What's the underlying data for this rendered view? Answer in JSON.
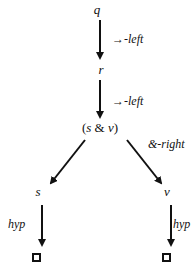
{
  "nodes": {
    "q": "q",
    "r": "r",
    "conj_open": "(",
    "conj_s": "s",
    "conj_amp": " & ",
    "conj_v": "v",
    "conj_close": ")",
    "s": "s",
    "v": "v"
  },
  "rules": {
    "q_to_r": "→-left",
    "r_to_conj": "→-left",
    "conj_split": "&-right",
    "s_hyp": "hyp",
    "v_hyp": "hyp"
  },
  "leaves": {
    "left": "closed-box",
    "right": "closed-box"
  }
}
